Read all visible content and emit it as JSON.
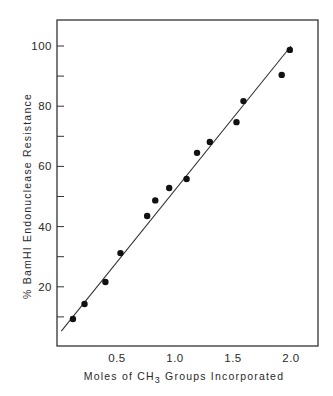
{
  "chart_data": {
    "type": "scatter",
    "title": "",
    "xlabel": "Moles of CH3 Groups Incorporated",
    "xlabel_parts": {
      "pre": "Moles of CH",
      "sub": "3",
      "post": " Groups Incorporated"
    },
    "ylabel": "% BamHI Endonuclease Resistance",
    "xlim": [
      0,
      2.23
    ],
    "ylim": [
      0,
      108
    ],
    "x_ticks": [
      0.5,
      1.0,
      1.5,
      2.0
    ],
    "x_tick_labels": [
      "0.5",
      "1.0",
      "1.5",
      "2.0"
    ],
    "y_ticks": [
      10,
      20,
      30,
      40,
      50,
      60,
      70,
      80,
      90,
      100
    ],
    "y_tick_labels": [
      "",
      "20",
      "",
      "40",
      "",
      "60",
      "",
      "80",
      "",
      "100"
    ],
    "grid": false,
    "legend": null,
    "series": [
      {
        "name": "measured",
        "type": "scatter",
        "x": [
          0.12,
          0.22,
          0.4,
          0.53,
          0.76,
          0.83,
          0.95,
          1.1,
          1.19,
          1.3,
          1.53,
          1.59,
          1.92,
          1.99
        ],
        "y": [
          9.3,
          14.3,
          21.6,
          31.2,
          43.5,
          48.7,
          52.8,
          55.8,
          64.5,
          68.1,
          74.7,
          81.7,
          90.4,
          98.7
        ]
      },
      {
        "name": "fit line",
        "type": "line",
        "x": [
          0.02,
          2.0
        ],
        "y": [
          5.3,
          100
        ]
      }
    ],
    "colors": {
      "axis": "#333333",
      "marker": "#111111",
      "line": "#333333",
      "text": "#2a2a2a",
      "background": "#ffffff"
    }
  }
}
